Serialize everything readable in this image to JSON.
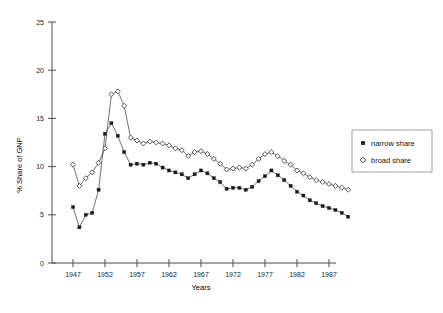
{
  "chart_data": {
    "type": "line",
    "title": "",
    "xlabel": "Years",
    "ylabel": "% Share of GNP",
    "xlim": [
      1946,
      1991
    ],
    "ylim": [
      0,
      25
    ],
    "grid": false,
    "legend_position": "right",
    "x_ticks": [
      1947,
      1952,
      1957,
      1962,
      1967,
      1972,
      1977,
      1982,
      1987
    ],
    "y_ticks": [
      0,
      5,
      10,
      15,
      20,
      25
    ],
    "x": [
      1947,
      1948,
      1949,
      1950,
      1951,
      1952,
      1953,
      1954,
      1955,
      1956,
      1957,
      1958,
      1959,
      1960,
      1961,
      1962,
      1963,
      1964,
      1965,
      1966,
      1967,
      1968,
      1969,
      1970,
      1971,
      1972,
      1973,
      1974,
      1975,
      1976,
      1977,
      1978,
      1979,
      1980,
      1981,
      1982,
      1983,
      1984,
      1985,
      1986,
      1987,
      1988,
      1989,
      1990
    ],
    "series": [
      {
        "name": "narrow share",
        "marker": "filled-square",
        "color": "#1a1a1a",
        "values": [
          5.8,
          3.7,
          5.0,
          5.2,
          7.6,
          13.4,
          14.5,
          13.2,
          11.5,
          10.2,
          10.3,
          10.2,
          10.4,
          10.3,
          9.9,
          9.6,
          9.4,
          9.2,
          8.8,
          9.2,
          9.6,
          9.3,
          8.8,
          8.4,
          7.7,
          7.8,
          7.8,
          7.6,
          7.9,
          8.5,
          9.0,
          9.6,
          9.1,
          8.6,
          8.0,
          7.4,
          7.0,
          6.5,
          6.2,
          5.9,
          5.7,
          5.5,
          5.2,
          4.8
        ]
      },
      {
        "name": "broad share",
        "marker": "open-diamond",
        "color": "#222222",
        "values": [
          10.2,
          8.0,
          8.8,
          9.4,
          10.4,
          11.9,
          17.5,
          17.8,
          16.3,
          13.0,
          12.7,
          12.4,
          12.6,
          12.5,
          12.4,
          12.2,
          11.9,
          11.7,
          11.1,
          11.5,
          11.6,
          11.3,
          10.8,
          10.3,
          9.7,
          9.8,
          9.9,
          9.8,
          10.2,
          10.8,
          11.3,
          11.5,
          11.1,
          10.6,
          10.2,
          9.6,
          9.3,
          8.9,
          8.6,
          8.4,
          8.2,
          8.0,
          7.8,
          7.6
        ]
      }
    ]
  },
  "legend": {
    "entries": [
      {
        "label": "narrow share",
        "marker": "filled-square"
      },
      {
        "label": "broad share",
        "marker": "open-diamond"
      }
    ]
  },
  "axes": {
    "x_title": "Years",
    "y_title": "% Share of GNP"
  },
  "caption": {
    "text": ""
  }
}
